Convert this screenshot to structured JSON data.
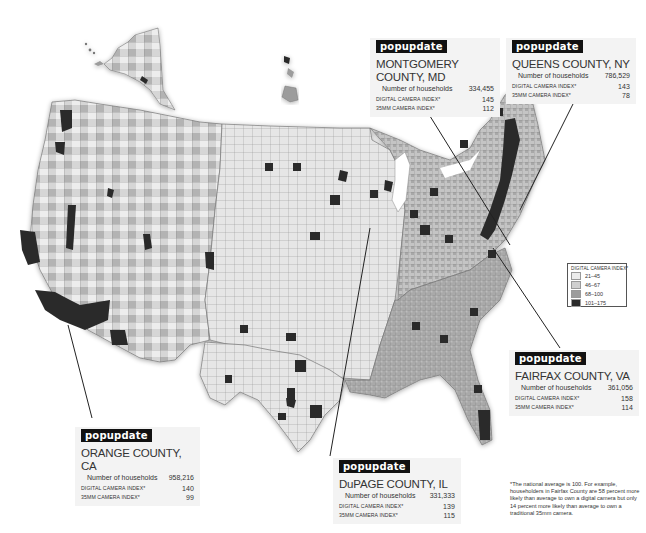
{
  "map": {
    "subject": "Digital camera ownership index by U.S. county",
    "colors": {
      "bin_1": "#ececec",
      "bin_2": "#cfcfcf",
      "bin_3": "#9c9c9c",
      "bin_4": "#2a2a2a",
      "border": "#777777",
      "leader_line": "#222222",
      "tag_bg": "#111111"
    }
  },
  "legend": {
    "title": "DIGITAL CAMERA INDEX*",
    "items": [
      {
        "label": "21–45",
        "color": "#ececec"
      },
      {
        "label": "46–67",
        "color": "#cfcfcf"
      },
      {
        "label": "68–100",
        "color": "#9c9c9c"
      },
      {
        "label": "101–175",
        "color": "#2a2a2a"
      }
    ]
  },
  "callouts": {
    "montgomery": {
      "tag": "popupdate",
      "county": "MONTGOMERY COUNTY, MD",
      "households_label": "Number of households",
      "households": "334,455",
      "digital_label": "DIGITAL CAMERA INDEX*",
      "digital": "145",
      "film_label": "35mm CAMERA INDEX*",
      "film": "112"
    },
    "queens": {
      "tag": "popupdate",
      "county": "QUEENS COUNTY, NY",
      "households_label": "Number of households",
      "households": "786,529",
      "digital_label": "DIGITAL CAMERA INDEX*",
      "digital": "143",
      "film_label": "35mm CAMERA INDEX*",
      "film": "78"
    },
    "fairfax": {
      "tag": "popupdate",
      "county": "FAIRFAX COUNTY, VA",
      "households_label": "Number of households",
      "households": "361,056",
      "digital_label": "DIGITAL CAMERA INDEX*",
      "digital": "158",
      "film_label": "35mm CAMERA INDEX*",
      "film": "114"
    },
    "orange": {
      "tag": "popupdate",
      "county": "ORANGE COUNTY, CA",
      "households_label": "Number of households",
      "households": "958,216",
      "digital_label": "DIGITAL CAMERA INDEX*",
      "digital": "140",
      "film_label": "35mm CAMERA INDEX*",
      "film": "99"
    },
    "dupage": {
      "tag": "popupdate",
      "county": "DuPAGE COUNTY, IL",
      "households_label": "Number of households",
      "households": "331,333",
      "digital_label": "DIGITAL CAMERA INDEX*",
      "digital": "139",
      "film_label": "35mm CAMERA INDEX*",
      "film": "115"
    }
  },
  "footnote": "*The national average is 100. For example, householders in Fairfax County are 58 percent more likely than average to own a digital camera but only 14 percent more likely than average to own a traditional 35mm camera."
}
